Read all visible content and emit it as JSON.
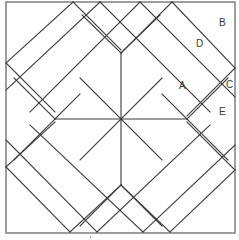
{
  "diagram": {
    "stroke_color": "#3a3a3a",
    "border_color": "#6a6a6a",
    "background": "#ffffff",
    "labels": [
      {
        "id": "A",
        "text": "A",
        "x": 179,
        "y": 81
      },
      {
        "id": "B",
        "text": "B",
        "x": 219,
        "y": 18
      },
      {
        "id": "C",
        "text": "C",
        "x": 226,
        "y": 80
      },
      {
        "id": "D",
        "text": "D",
        "x": 196,
        "y": 39
      },
      {
        "id": "E",
        "text": "E",
        "x": 219,
        "y": 107
      }
    ],
    "border": {
      "x": 6,
      "y": 2,
      "width": 229,
      "height": 231
    },
    "center": {
      "x": 121,
      "y": 119
    },
    "lines": [
      {
        "name": "center-vertical",
        "x1": 121,
        "y1": 53,
        "x2": 121,
        "y2": 185
      },
      {
        "name": "center-horizontal",
        "x1": 55,
        "y1": 119,
        "x2": 187,
        "y2": 119
      },
      {
        "name": "diag-nw-se",
        "x1": 55,
        "y1": 53,
        "x2": 187,
        "y2": 185
      },
      {
        "name": "diag-ne-sw",
        "x1": 187,
        "y1": 53,
        "x2": 55,
        "y2": 185
      },
      {
        "name": "top-v-left",
        "x1": 100,
        "y1": 2,
        "x2": 121,
        "y2": 23
      },
      {
        "name": "top-v-left-2",
        "x1": 73,
        "y1": 2,
        "x2": 121,
        "y2": 50
      },
      {
        "name": "top-v-right",
        "x1": 140,
        "y1": 2,
        "x2": 121,
        "y2": 21
      },
      {
        "name": "top-v-right-2",
        "x1": 172,
        "y1": 2,
        "x2": 121,
        "y2": 53
      },
      {
        "name": "nw-outer-strip-a",
        "x1": 73,
        "y1": 2,
        "x2": 6,
        "y2": 63
      },
      {
        "name": "nw-outer-strip-b",
        "x1": 100,
        "y1": 2,
        "x2": 6,
        "y2": 90
      },
      {
        "name": "nw-inner-a",
        "x1": 6,
        "y1": 63,
        "x2": 62,
        "y2": 119
      },
      {
        "name": "nw-inner-b",
        "x1": 55,
        "y1": 53,
        "x2": 121,
        "y2": 119
      },
      {
        "name": "nw-top-a",
        "x1": 73,
        "y1": 2,
        "x2": 190,
        "y2": 119
      },
      {
        "name": "nw-v",
        "x1": 55,
        "y1": 53,
        "x2": 121,
        "y2": 53
      },
      {
        "name": "ne-outer-strip-a",
        "x1": 140,
        "y1": 2,
        "x2": 235,
        "y2": 97
      },
      {
        "name": "ne-outer-strip-b",
        "x1": 172,
        "y1": 2,
        "x2": 235,
        "y2": 68
      },
      {
        "name": "ne-inner-a",
        "x1": 235,
        "y1": 68,
        "x2": 187,
        "y2": 119
      },
      {
        "name": "ne-inner-b",
        "x1": 187,
        "y1": 53,
        "x2": 121,
        "y2": 119
      },
      {
        "name": "se-outer-strip-a",
        "x1": 235,
        "y1": 145,
        "x2": 170,
        "y2": 232
      },
      {
        "name": "se-outer-strip-b",
        "x1": 235,
        "y1": 170,
        "x2": 143,
        "y2": 232
      },
      {
        "name": "se-inner-a",
        "x1": 187,
        "y1": 119,
        "x2": 235,
        "y2": 170
      },
      {
        "name": "se-inner-b",
        "x1": 121,
        "y1": 185,
        "x2": 187,
        "y2": 119
      },
      {
        "name": "sw-outer-strip-a",
        "x1": 6,
        "y1": 140,
        "x2": 97,
        "y2": 232
      },
      {
        "name": "sw-outer-strip-b",
        "x1": 6,
        "y1": 167,
        "x2": 70,
        "y2": 232
      },
      {
        "name": "sw-inner-a",
        "x1": 55,
        "y1": 119,
        "x2": 6,
        "y2": 167
      },
      {
        "name": "sw-inner-b",
        "x1": 121,
        "y1": 185,
        "x2": 55,
        "y2": 119
      }
    ]
  }
}
